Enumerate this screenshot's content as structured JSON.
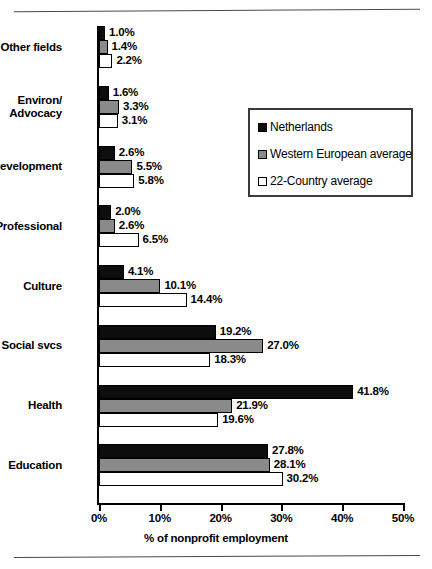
{
  "chart_data": {
    "type": "bar",
    "orientation": "horizontal",
    "title": "",
    "xlabel": "% of nonprofit employment",
    "ylabel": "",
    "xlim": [
      0,
      50
    ],
    "grid": false,
    "legend_position": "upper right",
    "tick_labels": [
      "0%",
      "10%",
      "20%",
      "30%",
      "40%",
      "50%"
    ],
    "tick_values": [
      0,
      10,
      20,
      30,
      40,
      50
    ],
    "categories": [
      "Other fields",
      "Environ/ Advocacy",
      "Development",
      "Professional",
      "Culture",
      "Social svcs",
      "Health",
      "Education"
    ],
    "category_lines": [
      [
        "Other fields"
      ],
      [
        "Environ/",
        "Advocacy"
      ],
      [
        "Development"
      ],
      [
        "Professional"
      ],
      [
        "Culture"
      ],
      [
        "Social svcs"
      ],
      [
        "Health"
      ],
      [
        "Education"
      ]
    ],
    "series": [
      {
        "name": "Netherlands",
        "color": "#0d0d0d",
        "values": [
          1.0,
          1.6,
          2.6,
          2.0,
          4.1,
          19.2,
          41.8,
          27.8
        ],
        "labels": [
          "1.0%",
          "1.6%",
          "2.6%",
          "2.0%",
          "4.1%",
          "19.2%",
          "41.8%",
          "27.8%"
        ]
      },
      {
        "name": "Western European average",
        "color": "#8a8a8a",
        "values": [
          1.4,
          3.3,
          5.5,
          2.6,
          10.1,
          27.0,
          21.9,
          28.1
        ],
        "labels": [
          "1.4%",
          "3.3%",
          "5.5%",
          "2.6%",
          "10.1%",
          "27.0%",
          "21.9%",
          "28.1%"
        ]
      },
      {
        "name": "22-Country average",
        "color": "#ffffff",
        "values": [
          2.2,
          3.1,
          5.8,
          6.5,
          14.4,
          18.3,
          19.6,
          30.2
        ],
        "labels": [
          "2.2%",
          "3.1%",
          "5.8%",
          "6.5%",
          "14.4%",
          "18.3%",
          "19.6%",
          "30.2%"
        ]
      }
    ]
  },
  "legend": {
    "items": [
      {
        "label": "Netherlands",
        "swatch": "black-square-icon"
      },
      {
        "label": "Western European average",
        "swatch": "gray-square-icon"
      },
      {
        "label": "22-Country average",
        "swatch": "white-square-icon"
      }
    ]
  }
}
